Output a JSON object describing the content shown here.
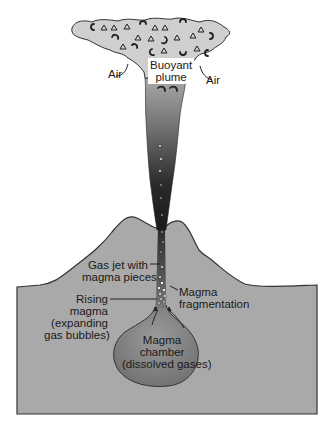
{
  "figure": {
    "type": "volcanic eruption column cross-section",
    "colors": {
      "background": "#ffffff",
      "ground_fill": "#a9a9a9",
      "ground_outline": "#333333",
      "cloud_fill": "#cfcfcf",
      "column_top": "#9a9a9a",
      "column_bottom": "#1c1c1c",
      "chamber_fill": "#8a8a8a",
      "text": "#1a1a1a"
    }
  },
  "labels": {
    "buoyant_plume": [
      "Buoyant",
      "plume"
    ],
    "air_left": "Air",
    "air_right": "Air",
    "gas_jet": [
      "Gas jet with",
      "magma pieces"
    ],
    "rising_magma": [
      "Rising",
      "magma",
      "(expanding",
      "gas bubbles)"
    ],
    "magma_fragmentation": [
      "Magma",
      "fragmentation"
    ],
    "magma_chamber": [
      "Magma",
      "chamber",
      "(dissolved gases)"
    ]
  }
}
